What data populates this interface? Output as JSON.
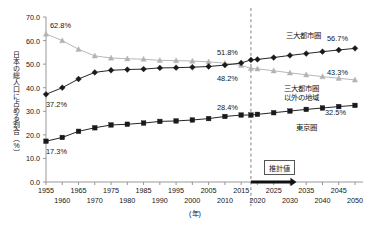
{
  "chart_data": {
    "type": "line",
    "title": "",
    "xlabel": "(年)",
    "ylabel": "日本の総人口に占める割合（%）",
    "ylim": [
      0.0,
      70.0
    ],
    "xlim": [
      1955,
      2050
    ],
    "grid": false,
    "legend_position": "inline-right",
    "ytick_labels": [
      "0.0",
      "10.0",
      "20.0",
      "30.0",
      "40.0",
      "50.0",
      "60.0",
      "70.0"
    ],
    "ytick_values": [
      0.0,
      10.0,
      20.0,
      30.0,
      40.0,
      50.0,
      60.0,
      70.0
    ],
    "xtick_labels_upper": [
      "1955",
      "1965",
      "1975",
      "1985",
      "1995",
      "2005",
      "2015",
      "2025",
      "2035",
      "2045"
    ],
    "xtick_values_upper": [
      1955,
      1965,
      1975,
      1985,
      1995,
      2005,
      2015,
      2025,
      2035,
      2045
    ],
    "xtick_labels_lower": [
      "1960",
      "1970",
      "1980",
      "1990",
      "2000",
      "2010",
      "2020",
      "2030",
      "2040",
      "2050"
    ],
    "xtick_values_lower": [
      1960,
      1970,
      1980,
      1990,
      2000,
      2010,
      2020,
      2030,
      2040,
      2050
    ],
    "x": [
      1955,
      1960,
      1965,
      1970,
      1975,
      1980,
      1985,
      1990,
      1995,
      2000,
      2005,
      2010,
      2015,
      2018,
      2020,
      2025,
      2030,
      2035,
      2040,
      2045,
      2050
    ],
    "series": [
      {
        "name": "三大都市圏以外の地域",
        "marker": "triangle",
        "color": "#b3b3b3",
        "values": [
          62.8,
          60.0,
          56.3,
          53.5,
          52.6,
          52.3,
          52.1,
          51.6,
          51.5,
          51.3,
          51.0,
          50.4,
          49.5,
          48.2,
          48.0,
          47.2,
          46.3,
          45.5,
          44.7,
          44.0,
          43.3
        ]
      },
      {
        "name": "三大都市圏",
        "marker": "diamond",
        "color": "#1a1a1a",
        "values": [
          37.2,
          40.0,
          43.7,
          46.5,
          47.4,
          47.7,
          47.9,
          48.4,
          48.5,
          48.7,
          49.0,
          49.6,
          50.5,
          51.8,
          52.0,
          52.8,
          53.7,
          54.5,
          55.3,
          56.0,
          56.7
        ]
      },
      {
        "name": "東京圏",
        "marker": "square",
        "color": "#1a1a1a",
        "values": [
          17.3,
          18.9,
          21.5,
          23.0,
          24.2,
          24.5,
          25.0,
          25.7,
          25.9,
          26.3,
          26.9,
          27.8,
          28.4,
          28.4,
          28.7,
          29.4,
          30.1,
          30.8,
          31.4,
          32.0,
          32.5
        ]
      }
    ],
    "annotations": [
      {
        "text": "62.8%",
        "x": 1955,
        "y": 62.8,
        "pos": "upper-right"
      },
      {
        "text": "37.2%",
        "x": 1955,
        "y": 37.2,
        "pos": "lower-right"
      },
      {
        "text": "17.3%",
        "x": 1955,
        "y": 17.3,
        "pos": "lower-right"
      },
      {
        "text": "51.8%",
        "x": 2018,
        "y": 51.8,
        "pos": "upper-left"
      },
      {
        "text": "48.2%",
        "x": 2018,
        "y": 48.2,
        "pos": "lower-left"
      },
      {
        "text": "28.4%",
        "x": 2018,
        "y": 28.4,
        "pos": "upper-left"
      },
      {
        "text": "56.7%",
        "x": 2050,
        "y": 56.7,
        "pos": "upper-left"
      },
      {
        "text": "43.3%",
        "x": 2050,
        "y": 43.3,
        "pos": "upper-left"
      },
      {
        "text": "32.5%",
        "x": 2050,
        "y": 32.5,
        "pos": "lower-left"
      }
    ],
    "series_labels": [
      {
        "text": "三大都市圏",
        "lines": [
          "三大都市圏"
        ]
      },
      {
        "text": "三大都市圏以外の地域",
        "lines": [
          "三大都市圏",
          "以外の地域"
        ]
      },
      {
        "text": "東京圏",
        "lines": [
          "東京圏"
        ]
      }
    ],
    "estimate_marker": {
      "label": "推計値",
      "divider_year": 2018,
      "arrow_from": 2018,
      "arrow_to": 2032
    }
  }
}
